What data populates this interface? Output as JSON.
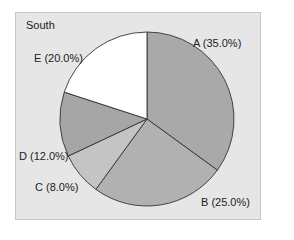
{
  "chart_data": {
    "type": "pie",
    "title": "South",
    "categories": [
      "A",
      "B",
      "C",
      "D",
      "E"
    ],
    "values": [
      35.0,
      25.0,
      8.0,
      12.0,
      20.0
    ],
    "labels": [
      "A (35.0%)",
      "B (25.0%)",
      "C (8.0%)",
      "D (12.0%)",
      "E (20.0%)"
    ],
    "colors": [
      "#a9a9a9",
      "#b1b1b1",
      "#c4c4c4",
      "#a6a6a6",
      "#ffffff"
    ],
    "start_angle_deg": 90,
    "direction": "clockwise",
    "legend": "none"
  },
  "panel": {
    "background": "#e6e6e6",
    "edge": "#c8c8c8"
  }
}
